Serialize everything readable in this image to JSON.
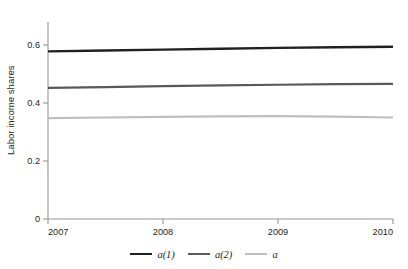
{
  "figure": {
    "caption_fragment": "",
    "background": "#ffffff"
  },
  "chart_data": {
    "type": "line",
    "title": "",
    "subtitle": "",
    "xlabel": "",
    "ylabel": "Labor income shares",
    "xlim": [
      2007,
      2010
    ],
    "ylim": [
      0,
      0.65
    ],
    "xticks": [
      "2007",
      "2008",
      "2009",
      "2010"
    ],
    "xtick_values": [
      2007,
      2008,
      2009,
      2010
    ],
    "yticks": [
      "0",
      "0.2",
      "0.4",
      "0.6"
    ],
    "ytick_values": [
      0,
      0.2,
      0.4,
      0.6
    ],
    "grid": false,
    "legend_position": "bottom-center",
    "x": [
      2007,
      2007.5,
      2008,
      2008.5,
      2009,
      2009.5,
      2010
    ],
    "series": [
      {
        "name": "a(1)",
        "color": "#231f20",
        "values": [
          0.578,
          0.581,
          0.584,
          0.587,
          0.59,
          0.592,
          0.594
        ]
      },
      {
        "name": "a(2)",
        "color": "#58595b",
        "values": [
          0.452,
          0.455,
          0.458,
          0.461,
          0.463,
          0.465,
          0.466
        ]
      },
      {
        "name": "a",
        "color": "#bcbec0",
        "values": [
          0.348,
          0.35,
          0.352,
          0.354,
          0.355,
          0.353,
          0.35
        ]
      }
    ]
  },
  "axis": {
    "y_title": "Labor income shares",
    "y_tick_labels": [
      "0.6",
      "0.4",
      "0.2",
      "0"
    ],
    "x_tick_labels": [
      "2007",
      "2008",
      "2009",
      "2010"
    ],
    "axis_color": "#939598"
  },
  "legend": {
    "items": [
      {
        "label": "a(1)",
        "color": "#231f20"
      },
      {
        "label": "a(2)",
        "color": "#58595b"
      },
      {
        "label": "a",
        "color": "#bcbec0"
      }
    ]
  }
}
